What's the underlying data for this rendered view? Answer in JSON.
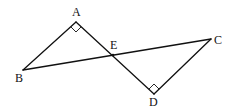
{
  "diagram": {
    "type": "geometry",
    "points": {
      "A": {
        "x": 76,
        "y": 22,
        "label": "A",
        "lx": 72,
        "ly": 16
      },
      "B": {
        "x": 23,
        "y": 70,
        "label": "B",
        "lx": 15,
        "ly": 82
      },
      "C": {
        "x": 211,
        "y": 39,
        "label": "C",
        "lx": 214,
        "ly": 44
      },
      "D": {
        "x": 154,
        "y": 94,
        "label": "D",
        "lx": 149,
        "ly": 106
      },
      "E": {
        "x": 113,
        "y": 55,
        "label": "E",
        "lx": 110,
        "ly": 49
      }
    },
    "segments": [
      [
        "A",
        "B"
      ],
      [
        "A",
        "D"
      ],
      [
        "B",
        "C"
      ],
      [
        "C",
        "D"
      ]
    ],
    "right_angles": [
      "A",
      "D"
    ],
    "labels": [
      "A",
      "B",
      "C",
      "D",
      "E"
    ]
  }
}
